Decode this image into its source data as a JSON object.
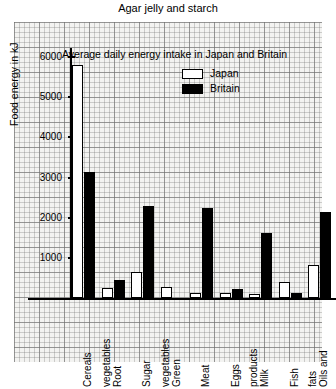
{
  "caption": "Agar jelly and starch",
  "chart": {
    "title": "Average daily energy intake in Japan and Britain",
    "y_axis_title": "Food energy in kJ",
    "y_ticks": [
      "1000",
      "2000",
      "3000",
      "4000",
      "5000",
      "6000"
    ],
    "legend": [
      {
        "name": "Japan",
        "style": "outlined"
      },
      {
        "name": "Britain",
        "style": "filled"
      }
    ],
    "categories": [
      {
        "line1": "Cereals",
        "line2": ""
      },
      {
        "line1": "Root",
        "line2": "vegetables"
      },
      {
        "line1": "Sugar",
        "line2": ""
      },
      {
        "line1": "Green",
        "line2": "vegetables"
      },
      {
        "line1": "Meat",
        "line2": ""
      },
      {
        "line1": "Eggs",
        "line2": ""
      },
      {
        "line1": "Milk",
        "line2": "products"
      },
      {
        "line1": "Fish",
        "line2": ""
      },
      {
        "line1": "Oils and",
        "line2": "fats"
      }
    ]
  },
  "chart_data": {
    "type": "bar",
    "title": "Average daily energy intake in Japan and Britain",
    "xlabel": "",
    "ylabel": "Food energy in kJ",
    "ylim": [
      0,
      6200
    ],
    "yticks": [
      1000,
      2000,
      3000,
      4000,
      5000,
      6000
    ],
    "grid": true,
    "legend_position": "upper-right-inside",
    "categories": [
      "Cereals",
      "Root vegetables",
      "Sugar",
      "Green vegetables",
      "Meat",
      "Eggs",
      "Milk products",
      "Fish",
      "Oils and fats"
    ],
    "series": [
      {
        "name": "Japan",
        "color": "#ffffff",
        "values": [
          5800,
          250,
          650,
          270,
          120,
          130,
          110,
          400,
          820
        ]
      },
      {
        "name": "Britain",
        "color": "#000000",
        "values": [
          3150,
          450,
          2300,
          0,
          2250,
          230,
          1620,
          130,
          2150
        ]
      }
    ]
  },
  "colors": {
    "japan": "#ffffff",
    "britain": "#000000",
    "axis": "#000000",
    "paper": "#f3f3f1"
  }
}
